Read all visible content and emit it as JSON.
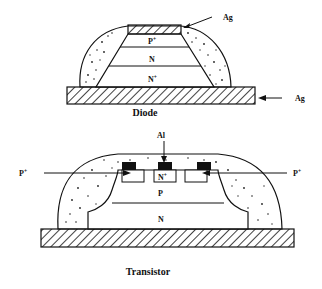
{
  "diagrams": [
    {
      "id": "diode",
      "caption": "Diode",
      "layers": [
        {
          "name": "P",
          "superscript": "+"
        },
        {
          "name": "N",
          "superscript": ""
        },
        {
          "name": "N",
          "superscript": "+"
        }
      ],
      "contacts": [
        {
          "label": "Ag",
          "location": "top"
        },
        {
          "label": "Ag",
          "location": "bottom"
        }
      ],
      "encapsulant": "dotted"
    },
    {
      "id": "transistor",
      "caption": "Transistor",
      "regions": [
        {
          "name": "N",
          "superscript": "+"
        },
        {
          "name": "P",
          "superscript": ""
        },
        {
          "name": "N",
          "superscript": ""
        }
      ],
      "contacts": [
        {
          "label": "Al",
          "location": "top-center"
        },
        {
          "label": "P",
          "superscript": "+",
          "location": "left"
        },
        {
          "label": "P",
          "superscript": "+",
          "location": "right"
        }
      ],
      "encapsulant": "dotted"
    }
  ]
}
